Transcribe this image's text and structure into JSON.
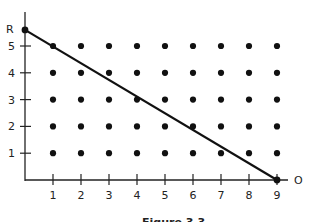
{
  "chart_data": {
    "type": "scatter",
    "title": "",
    "xlabel": "O",
    "ylabel": "R",
    "x_ticks": [
      "1",
      "2",
      "3",
      "4",
      "5",
      "6",
      "7",
      "8",
      "9"
    ],
    "y_ticks": [
      "1",
      "2",
      "3",
      "4",
      "5"
    ],
    "xlim": [
      0,
      9.5
    ],
    "ylim": [
      0,
      5.8
    ],
    "grid": false,
    "points": {
      "description": "Lattice of dots at every integer (x,y) for x=1..9, y=1..5",
      "x": [
        1,
        2,
        3,
        4,
        5,
        6,
        7,
        8,
        9
      ],
      "y": [
        1,
        2,
        3,
        4,
        5
      ]
    },
    "line": {
      "from": {
        "x": 0,
        "y": 5.6,
        "label": "R"
      },
      "to": {
        "x": 9,
        "y": 0
      },
      "description": "Straight line from R on the vertical axis down to 9 on the horizontal axis"
    },
    "endpoint_markers": [
      {
        "x": 0,
        "y": 5.6
      },
      {
        "x": 9,
        "y": 0
      }
    ],
    "caption": "Figure 3.3"
  },
  "labels": {
    "y_axis": "R",
    "x_axis": "O",
    "caption": "Figure 3.3"
  }
}
